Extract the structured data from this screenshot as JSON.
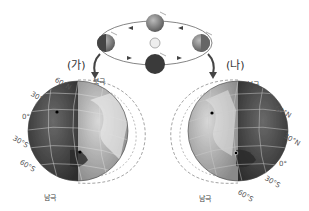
{
  "header": {
    "partial_text": ""
  },
  "orbit": {
    "sun_label": "",
    "earth_positions": [
      "top",
      "left",
      "right",
      "bottom"
    ]
  },
  "panels": [
    {
      "label": "(가)",
      "north_pole": "북극",
      "south_pole": "남극",
      "latitudes": [
        "60°N",
        "30°N",
        "0°",
        "30°S",
        "60°S"
      ]
    },
    {
      "label": "(나)",
      "north_pole": "북극",
      "south_pole": "남극",
      "latitudes": [
        "60°N",
        "30°N",
        "0°",
        "30°S",
        "60°S"
      ]
    }
  ],
  "colors": {
    "night": "#4a4a4a",
    "day": "#a9a9a9",
    "orbit": "#555555",
    "arrow": "#444444"
  }
}
